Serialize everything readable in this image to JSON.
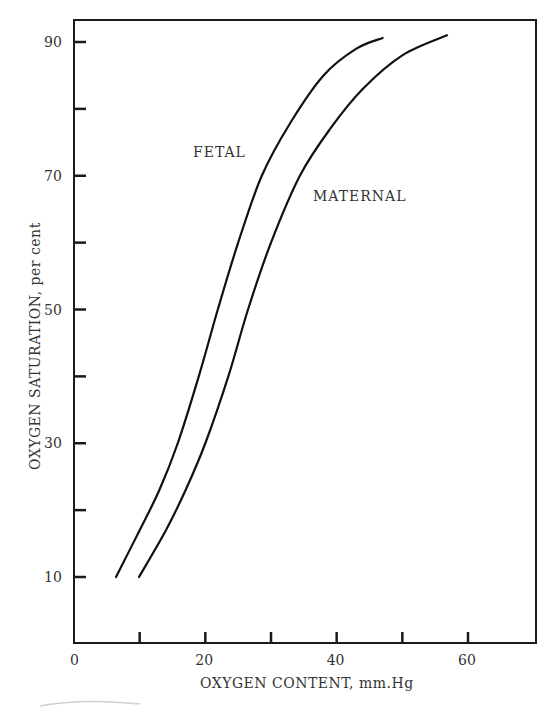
{
  "chart_data": {
    "type": "line",
    "title": "",
    "xlabel": "OXYGEN CONTENT, mm.Hg",
    "ylabel": "OXYGEN SATURATION, per cent",
    "xlim": [
      0,
      70
    ],
    "ylim": [
      0,
      94
    ],
    "x_ticks": [
      0,
      10,
      20,
      30,
      40,
      50,
      60
    ],
    "x_tick_labels": [
      "0",
      "",
      "20",
      "",
      "40",
      "",
      "60"
    ],
    "y_ticks": [
      10,
      20,
      30,
      40,
      50,
      60,
      70,
      80,
      90
    ],
    "y_tick_labels": [
      "10",
      "",
      "30",
      "",
      "50",
      "",
      "70",
      "",
      "90"
    ],
    "grid": false,
    "legend": "inline labels",
    "series": [
      {
        "name": "FETAL",
        "x": [
          6.4,
          10,
          13,
          15.8,
          19,
          21.9,
          25,
          28.6,
          33,
          38,
          43,
          47.0
        ],
        "y": [
          10,
          17,
          23,
          30,
          40,
          50,
          60,
          70,
          78,
          85,
          89,
          90.6
        ]
      },
      {
        "name": "MATERNAL",
        "x": [
          9.9,
          14,
          17,
          20,
          23.5,
          26.5,
          30,
          34.4,
          39,
          44,
          50,
          56.8
        ],
        "y": [
          10,
          17,
          23,
          30,
          40,
          50,
          60,
          70,
          77,
          83,
          88,
          91
        ]
      }
    ],
    "annotations": [
      {
        "text": "FETAL",
        "x": 21,
        "y": 73
      },
      {
        "text": "MATERNAL",
        "x": 36,
        "y": 67
      }
    ]
  }
}
